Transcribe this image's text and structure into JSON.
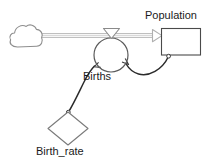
{
  "diagram": {
    "type": "system-dynamics-stock-and-flow",
    "title": null,
    "background_color": "#ffffff",
    "stroke_color": "#3f3f3f",
    "flow_pipe_color": "#b4b4b4",
    "label_color": "#1a1a1a",
    "nodes": [
      {
        "id": "source_cloud",
        "kind": "source-cloud",
        "label": "",
        "x": 10,
        "y": 24,
        "width": 32,
        "height": 24
      },
      {
        "id": "births",
        "kind": "flow-valve",
        "label": "Births",
        "label_x": 83,
        "label_y": 70,
        "circle_cx": 111,
        "circle_cy": 55,
        "circle_r": 17,
        "valve_x": 104,
        "valve_y": 28,
        "valve_width": 16,
        "valve_height": 10
      },
      {
        "id": "population",
        "kind": "stock",
        "label": "Population",
        "label_x": 145,
        "label_y": 9,
        "x": 161,
        "y": 28,
        "width": 40,
        "height": 27
      },
      {
        "id": "birth_rate",
        "kind": "converter-diamond",
        "label": "Birth_rate",
        "label_x": 36,
        "label_y": 145,
        "cx": 68,
        "cy": 128,
        "half_width": 20,
        "half_height": 17
      }
    ],
    "connectors": [
      {
        "id": "flow-source-to-population",
        "kind": "flow",
        "from": "source_cloud",
        "to": "population",
        "arrowhead": "hollow-triangle",
        "style": "double-line-pipe"
      },
      {
        "id": "link-population-to-births",
        "kind": "information-link",
        "from": "population",
        "to": "births",
        "arrowhead": "hollow-arrow",
        "style": "curved"
      },
      {
        "id": "link-birthrate-to-births",
        "kind": "information-link",
        "from": "birth_rate",
        "to": "births",
        "arrowhead": "hollow-arrow",
        "style": "curved"
      }
    ]
  }
}
